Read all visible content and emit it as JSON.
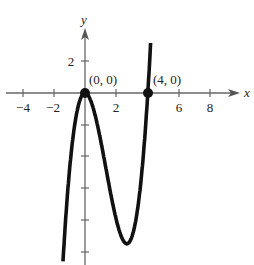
{
  "header": {
    "cropped_text": ""
  },
  "chart_data": {
    "type": "line",
    "title": "",
    "function": "f(x) = x^2 (x - 4)",
    "xlabel": "x",
    "ylabel": "y",
    "x_ticks": [
      -4,
      -2,
      2,
      6,
      8
    ],
    "x_tick_labels": [
      "−4",
      "−2",
      "2",
      "6",
      "8"
    ],
    "y_ticks": [
      2,
      -2,
      -4,
      -6,
      -8,
      -10
    ],
    "y_tick_labels": [
      "2"
    ],
    "xlim": [
      -5,
      10
    ],
    "ylim": [
      -11,
      3
    ],
    "grid": false,
    "series": [
      {
        "name": "f(x)",
        "x": [
          -1.3,
          -1,
          0,
          1,
          2,
          2.67,
          3,
          4,
          4.15
        ],
        "y": [
          -10.96,
          -5,
          0,
          -3,
          -8,
          -9.48,
          -9,
          0,
          2.6
        ]
      }
    ],
    "points": [
      {
        "label": "(0, 0)",
        "x": 0,
        "y": 0
      },
      {
        "label": "(4, 0)",
        "x": 4,
        "y": 0
      }
    ]
  },
  "labels": {
    "x_axis": "x",
    "y_axis": "y",
    "tick_neg4": "−4",
    "tick_neg2": "−2",
    "tick_2": "2",
    "tick_6": "6",
    "tick_8": "8",
    "tick_y2": "2",
    "point_origin": "(0, 0)",
    "point_four": "(4, 0)"
  }
}
